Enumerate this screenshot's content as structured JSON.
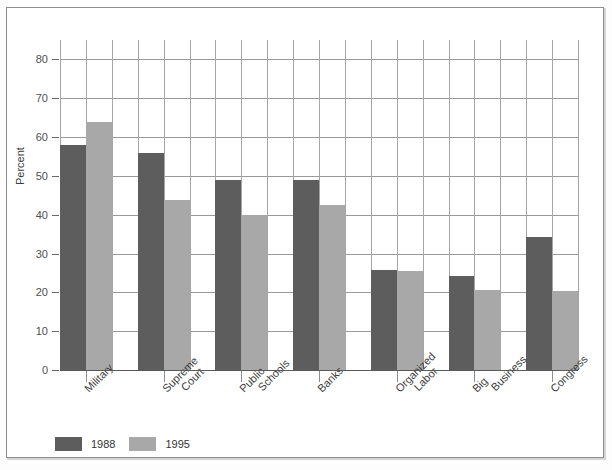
{
  "chart_data": {
    "type": "bar",
    "title": "",
    "xlabel": "",
    "ylabel": "Percent",
    "ylim": [
      0,
      85
    ],
    "yticks": [
      0,
      10,
      20,
      30,
      40,
      50,
      60,
      70,
      80
    ],
    "grid": true,
    "legend_position": "bottom-left",
    "categories": [
      "Military",
      "Supreme Court",
      "Public Schools",
      "Banks",
      "Organized Labor",
      "Big Business",
      "Congress"
    ],
    "category_lines": [
      [
        "Military"
      ],
      [
        "Supreme",
        "Court"
      ],
      [
        "Public",
        "Schools"
      ],
      [
        "Banks"
      ],
      [
        "Organized",
        "Labor"
      ],
      [
        "Big",
        "Business"
      ],
      [
        "Congress"
      ]
    ],
    "series": [
      {
        "name": "1988",
        "color": "#5d5d5d",
        "values": [
          58.0,
          56.0,
          49.0,
          49.0,
          25.7,
          24.3,
          34.2
        ]
      },
      {
        "name": "1995",
        "color": "#a8a8a8",
        "values": [
          64.0,
          43.8,
          39.8,
          42.5,
          25.6,
          20.5,
          20.4
        ]
      }
    ]
  },
  "legend": {
    "items": [
      {
        "label": "1988",
        "color": "#5d5d5d"
      },
      {
        "label": "1995",
        "color": "#a8a8a8"
      }
    ]
  },
  "axis": {
    "y_title": "Percent"
  }
}
